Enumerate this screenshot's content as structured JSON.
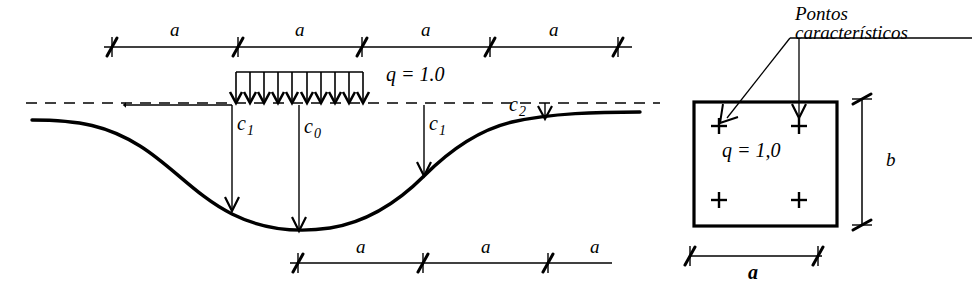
{
  "figure": {
    "width": 978,
    "height": 290,
    "background": "#ffffff",
    "stroke": "#000000"
  },
  "left_diagram": {
    "name": "settlement-trough-diagram",
    "top_dimension": {
      "label_repeat": "a",
      "segments": [
        {
          "label": "a"
        },
        {
          "label": "a"
        },
        {
          "label": "a"
        },
        {
          "label": "a"
        }
      ],
      "tick_x": [
        112,
        238,
        362,
        490,
        618
      ],
      "line_y": 47
    },
    "bottom_dimension": {
      "segments": [
        {
          "label": "a"
        },
        {
          "label": "a"
        },
        {
          "label": "a"
        }
      ],
      "tick_x": [
        298,
        423,
        548
      ],
      "line_y": 263
    },
    "load": {
      "label": "q = 1.0",
      "arrow_count": 9,
      "x_start": 236,
      "x_end": 363,
      "rail_y": 72,
      "tip_y": 103
    },
    "datum_line": {
      "y": 103,
      "x_start": 26,
      "x_end": 660,
      "style": "dashed"
    },
    "settlement_labels": [
      {
        "id": "c1-left",
        "base": "c",
        "sub": "1"
      },
      {
        "id": "c0-center",
        "base": "c",
        "sub": "0"
      },
      {
        "id": "c1-right",
        "base": "c",
        "sub": "1"
      },
      {
        "id": "c2-right",
        "base": "c",
        "sub": "2"
      }
    ]
  },
  "right_diagram": {
    "name": "footing-plan-diagram",
    "annotation": {
      "line1": "Pontos",
      "line2": "característicos"
    },
    "footing": {
      "load_label": "q = 1,0",
      "x": 694,
      "y": 102,
      "width": 143,
      "height": 124,
      "characteristic_points": [
        {
          "cx": 719,
          "cy": 126
        },
        {
          "cx": 799,
          "cy": 126
        },
        {
          "cx": 719,
          "cy": 200
        },
        {
          "cx": 799,
          "cy": 200
        }
      ]
    },
    "dim_b": {
      "label": "b",
      "x": 862,
      "y_top": 95,
      "y_bottom": 228
    },
    "dim_a": {
      "label": "a",
      "y": 256,
      "x_left": 690,
      "x_right": 820
    }
  }
}
